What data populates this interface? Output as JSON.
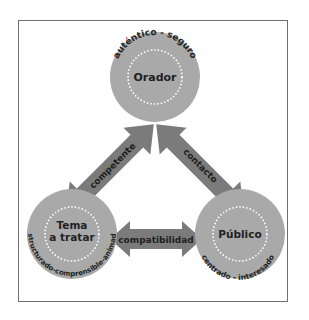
{
  "colors": {
    "circle_fill": "#a9a9a9",
    "arrow_fill": "#7b7b7b",
    "dotted_ring": "#ffffff",
    "frame_border": "#6e6e6e",
    "text": "#222222"
  },
  "nodes": {
    "orador": {
      "label": "Orador",
      "arc_label": "auténtico - seguro"
    },
    "tema": {
      "label_line1": "Tema",
      "label_line2": "a tratar",
      "arc_label": "estructurado-comprensible-animado"
    },
    "publico": {
      "label": "Público",
      "arc_label": "centrado - interesado"
    }
  },
  "arrows": {
    "orador_tema": {
      "label": "competente"
    },
    "orador_publico": {
      "label": "contacto"
    },
    "tema_publico": {
      "label": "compatibilidad"
    }
  }
}
